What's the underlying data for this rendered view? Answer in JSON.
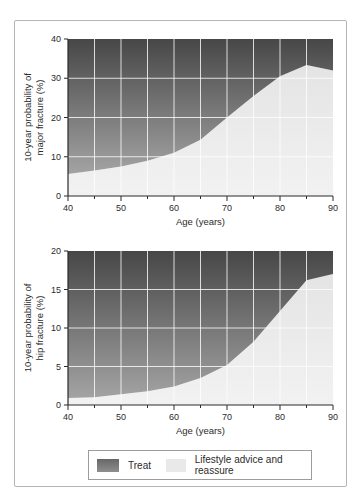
{
  "colors": {
    "treat_top": "#474747",
    "treat_bottom": "#a3a3a3",
    "lifestyle_top": "#e4e4e4",
    "lifestyle_bottom": "#f2f2f2",
    "grid": "#ffffff",
    "axis": "#2b2b2b",
    "frame_border": "#b5b5b5",
    "legend_border": "#9c9c9c",
    "legend_treat_top": "#676767",
    "legend_treat_bottom": "#8e8e8e",
    "legend_lifestyle": "#e9e9e9"
  },
  "legend": {
    "items": [
      {
        "label": "Treat",
        "swatch": "dark-gray-gradient"
      },
      {
        "label": "Lifestyle advice and reassure",
        "swatch": "light-gray"
      }
    ]
  },
  "chart_data": [
    {
      "type": "area",
      "title": "",
      "x": [
        40,
        45,
        50,
        55,
        60,
        65,
        70,
        75,
        80,
        85,
        90
      ],
      "threshold": [
        5.6,
        6.5,
        7.5,
        9.0,
        11.0,
        14.3,
        20.0,
        25.5,
        30.5,
        33.4,
        32.0
      ],
      "series": [
        {
          "name": "Treat",
          "region": "above_threshold"
        },
        {
          "name": "Lifestyle advice and reassure",
          "region": "below_threshold"
        }
      ],
      "xlabel": "Age (years)",
      "ylabel_lines": [
        "10-year probability of",
        "major fracture (%)"
      ],
      "xlim": [
        40,
        90
      ],
      "ylim": [
        0,
        40
      ],
      "x_major_ticks": [
        40,
        50,
        60,
        70,
        80,
        90
      ],
      "x_minor_ticks": [
        45,
        55,
        65,
        75,
        85
      ],
      "y_ticks": [
        0,
        10,
        20,
        30,
        40
      ],
      "grid_vertical": [
        45,
        50,
        55,
        60,
        65,
        70,
        75,
        80,
        85
      ],
      "grid_horizontal": [
        10,
        20,
        30
      ],
      "legend_position": "below-figure"
    },
    {
      "type": "area",
      "title": "",
      "x": [
        40,
        45,
        50,
        55,
        60,
        65,
        70,
        75,
        80,
        85,
        90
      ],
      "threshold": [
        0.9,
        1.0,
        1.4,
        1.8,
        2.4,
        3.5,
        5.2,
        8.2,
        12.2,
        16.2,
        17.0
      ],
      "series": [
        {
          "name": "Treat",
          "region": "above_threshold"
        },
        {
          "name": "Lifestyle advice and reassure",
          "region": "below_threshold"
        }
      ],
      "xlabel": "Age (years)",
      "ylabel_lines": [
        "10-year probability of",
        "hip fracture (%)"
      ],
      "xlim": [
        40,
        90
      ],
      "ylim": [
        0,
        20
      ],
      "x_major_ticks": [
        40,
        50,
        60,
        70,
        80,
        90
      ],
      "x_minor_ticks": [
        45,
        55,
        65,
        75,
        85
      ],
      "y_ticks": [
        0,
        5,
        10,
        15,
        20
      ],
      "grid_vertical": [
        45,
        50,
        55,
        60,
        65,
        70,
        75,
        80,
        85
      ],
      "grid_horizontal": [
        5,
        10,
        15
      ],
      "legend_position": "below-figure"
    }
  ]
}
